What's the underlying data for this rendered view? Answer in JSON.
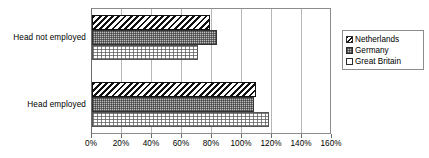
{
  "chart_data": {
    "type": "bar",
    "orientation": "horizontal",
    "title": "",
    "subtitle": "",
    "xlabel": "",
    "ylabel": "",
    "categories": [
      "Head not employed",
      "Head employed"
    ],
    "series": [
      {
        "name": "Netherlands",
        "values": [
          79,
          110
        ],
        "pattern": "diagonal-hatch"
      },
      {
        "name": "Germany",
        "values": [
          84,
          109
        ],
        "pattern": "cross-hatch-gray"
      },
      {
        "name": "Great Britain",
        "values": [
          71,
          119
        ],
        "pattern": "dotted-light"
      }
    ],
    "value_suffix": "%",
    "xlim": [
      0,
      160
    ],
    "xticks": [
      0,
      20,
      40,
      60,
      80,
      100,
      120,
      140,
      160
    ],
    "xtick_labels": [
      "0%",
      "20%",
      "40%",
      "60%",
      "80%",
      "100%",
      "120%",
      "140%",
      "160%"
    ],
    "grid": "vertical",
    "legend_position": "right",
    "legend_entries": [
      "Netherlands",
      "Germany",
      "Great Britain"
    ],
    "annotations": []
  },
  "colors": {
    "plot_border": "#8c8c8c",
    "gridline": "#b6b6b6",
    "axis": "#6d6d6d",
    "text": "#000000",
    "series_netherlands": "#111111",
    "series_germany": "#bdbdbd",
    "series_greatbritain": "#ffffff",
    "background": "#ffffff"
  }
}
